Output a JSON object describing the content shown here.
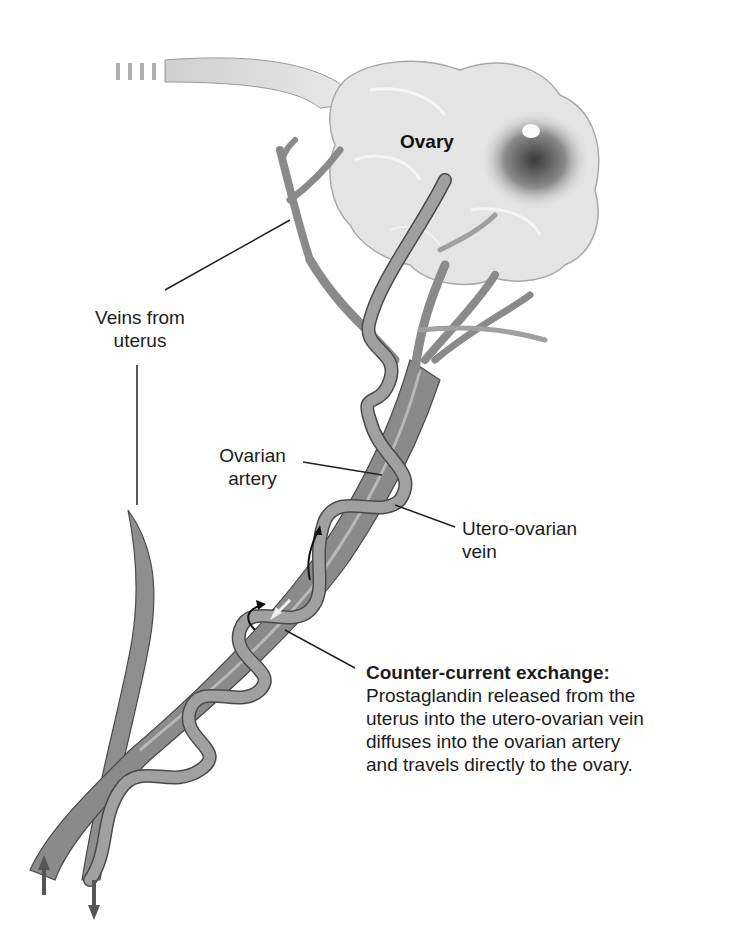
{
  "diagram": {
    "type": "anatomical illustration"
  },
  "labels": {
    "ovary": "Ovary",
    "veins_from_uterus": [
      "Veins from",
      "uterus"
    ],
    "ovarian_artery": [
      "Ovarian",
      "artery"
    ],
    "utero_ovarian_vein": [
      "Utero-ovarian",
      "vein"
    ]
  },
  "callout": {
    "title": "Counter-current exchange:",
    "lines": [
      "Prostaglandin released from the",
      "uterus into the utero-ovarian vein",
      "diffuses into the ovarian artery",
      "and travels directly to the ovary."
    ]
  },
  "colors": {
    "background": "#ffffff",
    "ovary_fill": "#e6e6e6",
    "follicle": "#6e6e6e",
    "vein_fill": "#8c8c8c",
    "artery_fill": "#9a9a9a",
    "outline": "#4a4a4a",
    "leader_line": "#222222"
  }
}
